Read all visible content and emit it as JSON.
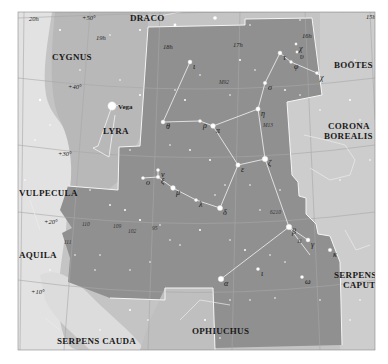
{
  "map": {
    "title": "Hercules star chart",
    "colors": {
      "page_bg": "#ffffff",
      "sky_outer": "#d3d3d3",
      "sky_mid": "#bdbdbd",
      "milky_way": "#e4e4e4",
      "hercules": "#8f8f8f",
      "boundary": "#ffffff",
      "gridline": "#9a9a9a",
      "figure_line": "#f2f2f2",
      "star": "#ffffff"
    },
    "constellations": [
      {
        "name": "DRACO",
        "x": 130,
        "y": 21
      },
      {
        "name": "CYGNUS",
        "x": 52,
        "y": 60
      },
      {
        "name": "BOÖTES",
        "x": 334,
        "y": 68
      },
      {
        "name": "LYRA",
        "x": 103,
        "y": 134
      },
      {
        "name": "CORONA",
        "x": 328,
        "y": 129
      },
      {
        "name": "BOREALIS",
        "x": 324,
        "y": 139
      },
      {
        "name": "VULPECULA",
        "x": 19,
        "y": 196
      },
      {
        "name": "AQUILA",
        "x": 19,
        "y": 258
      },
      {
        "name": "SERPENS",
        "x": 334,
        "y": 278
      },
      {
        "name": "CAPUT",
        "x": 343,
        "y": 288
      },
      {
        "name": "OPHIUCHUS",
        "x": 192,
        "y": 334
      },
      {
        "name": "SERPENS CAUDA",
        "x": 57,
        "y": 344
      }
    ],
    "grid_labels": [
      {
        "text": "20h",
        "x": 29,
        "y": 21
      },
      {
        "text": "+50°",
        "x": 82,
        "y": 20
      },
      {
        "text": "19h",
        "x": 96,
        "y": 40
      },
      {
        "text": "18h",
        "x": 163,
        "y": 49
      },
      {
        "text": "17h",
        "x": 233,
        "y": 47
      },
      {
        "text": "16h",
        "x": 302,
        "y": 38
      },
      {
        "text": "15h",
        "x": 366,
        "y": 19
      },
      {
        "text": "+40°",
        "x": 68,
        "y": 89
      },
      {
        "text": "+30°",
        "x": 58,
        "y": 156
      },
      {
        "text": "+20°",
        "x": 44,
        "y": 224
      },
      {
        "text": "+10°",
        "x": 31,
        "y": 294
      }
    ],
    "stars_labeled": [
      {
        "label": "Vega",
        "x": 112,
        "y": 106,
        "r": 4.2,
        "cls": "vega"
      },
      {
        "label": "τ",
        "x": 280,
        "y": 53,
        "r": 2,
        "cls": "star"
      },
      {
        "label": "χ",
        "x": 296,
        "y": 44,
        "r": 1.2,
        "cls": "star"
      },
      {
        "label": "υ",
        "x": 297,
        "y": 52,
        "r": 1.2,
        "cls": "star"
      },
      {
        "label": "φ",
        "x": 291,
        "y": 62,
        "r": 1.4,
        "cls": "star"
      },
      {
        "label": "χ",
        "x": 317,
        "y": 73,
        "r": 1.6,
        "cls": "star"
      },
      {
        "label": "ι",
        "x": 190,
        "y": 62,
        "r": 2,
        "cls": "star"
      },
      {
        "label": "σ",
        "x": 265,
        "y": 83,
        "r": 1.8,
        "cls": "star"
      },
      {
        "label": "η",
        "x": 258,
        "y": 109,
        "r": 2.2,
        "cls": "star"
      },
      {
        "label": "θ",
        "x": 163,
        "y": 122,
        "r": 2,
        "cls": "star"
      },
      {
        "label": "ρ",
        "x": 200,
        "y": 121,
        "r": 1.6,
        "cls": "star"
      },
      {
        "label": "π",
        "x": 213,
        "y": 126,
        "r": 2.4,
        "cls": "star"
      },
      {
        "label": "ζ",
        "x": 265,
        "y": 159,
        "r": 2.8,
        "cls": "star"
      },
      {
        "label": "ε",
        "x": 238,
        "y": 165,
        "r": 2.2,
        "cls": "star"
      },
      {
        "label": "ν",
        "x": 158,
        "y": 170,
        "r": 1.6,
        "cls": "star"
      },
      {
        "label": "ο",
        "x": 143,
        "y": 178,
        "r": 1.6,
        "cls": "star"
      },
      {
        "label": "ξ",
        "x": 158,
        "y": 177,
        "r": 1.8,
        "cls": "star"
      },
      {
        "label": "μ",
        "x": 173,
        "y": 188,
        "r": 2.4,
        "cls": "star"
      },
      {
        "label": "λ",
        "x": 196,
        "y": 200,
        "r": 1.6,
        "cls": "star"
      },
      {
        "label": "δ",
        "x": 220,
        "y": 208,
        "r": 2.6,
        "cls": "star"
      },
      {
        "label": "β",
        "x": 289,
        "y": 227,
        "r": 2.8,
        "cls": "star"
      },
      {
        "label": "γ",
        "x": 308,
        "y": 240,
        "r": 2,
        "cls": "star"
      },
      {
        "label": "ω",
        "x": 302,
        "y": 277,
        "r": 1.6,
        "cls": "star"
      },
      {
        "label": "κ",
        "x": 330,
        "y": 250,
        "r": 1.8,
        "cls": "star"
      },
      {
        "label": "α",
        "x": 221,
        "y": 279,
        "r": 2.8,
        "cls": "star"
      },
      {
        "label": "ι",
        "x": 258,
        "y": 269,
        "r": 1.6,
        "cls": "star"
      }
    ],
    "star_number_labels": [
      {
        "text": "M92",
        "x": 219,
        "y": 84
      },
      {
        "text": "M13",
        "x": 263,
        "y": 127
      },
      {
        "text": "6210",
        "x": 270,
        "y": 214
      },
      {
        "text": "110",
        "x": 82,
        "y": 226
      },
      {
        "text": "109",
        "x": 113,
        "y": 228
      },
      {
        "text": "102",
        "x": 128,
        "y": 233
      },
      {
        "text": "95",
        "x": 152,
        "y": 230
      },
      {
        "text": "111",
        "x": 64,
        "y": 244
      },
      {
        "text": "11",
        "x": 297,
        "y": 243
      }
    ],
    "figure_lines": [
      [
        [
          280,
          53
        ],
        [
          265,
          83
        ],
        [
          258,
          109
        ],
        [
          213,
          126
        ],
        [
          200,
          121
        ],
        [
          163,
          122
        ],
        [
          190,
          62
        ]
      ],
      [
        [
          280,
          53
        ],
        [
          291,
          62
        ],
        [
          317,
          73
        ],
        [
          320,
          76
        ]
      ],
      [
        [
          258,
          109
        ],
        [
          265,
          159
        ],
        [
          238,
          165
        ],
        [
          213,
          126
        ]
      ],
      [
        [
          238,
          165
        ],
        [
          220,
          208
        ],
        [
          196,
          200
        ],
        [
          173,
          188
        ],
        [
          158,
          177
        ],
        [
          143,
          178
        ]
      ],
      [
        [
          158,
          177
        ],
        [
          158,
          170
        ]
      ],
      [
        [
          265,
          159
        ],
        [
          289,
          227
        ],
        [
          308,
          240
        ]
      ],
      [
        [
          289,
          227
        ],
        [
          221,
          279
        ]
      ],
      [
        [
          289,
          227
        ],
        [
          310,
          255
        ]
      ],
      [
        [
          112,
          106
        ],
        [
          98,
          146
        ],
        [
          93,
          148
        ],
        [
          109,
          157
        ],
        [
          115,
          115
        ]
      ],
      [
        [
          112,
          106
        ],
        [
          120,
          105
        ]
      ]
    ],
    "neighbor_lines": [
      [
        [
          133,
          14
        ],
        [
          150,
          18
        ],
        [
          190,
          10
        ]
      ],
      [
        [
          304,
          135
        ],
        [
          326,
          140
        ],
        [
          345,
          145
        ],
        [
          355,
          160
        ],
        [
          350,
          175
        ],
        [
          330,
          180
        ],
        [
          310,
          168
        ]
      ],
      [
        [
          345,
          230
        ],
        [
          356,
          250
        ],
        [
          370,
          245
        ]
      ],
      [
        [
          180,
          320
        ],
        [
          200,
          300
        ],
        [
          230,
          305
        ]
      ],
      [
        [
          30,
          200
        ],
        [
          40,
          230
        ]
      ],
      [
        [
          45,
          318
        ],
        [
          60,
          330
        ]
      ]
    ],
    "background_stars": [
      [
        60,
        30,
        1
      ],
      [
        110,
        35,
        0.8
      ],
      [
        140,
        30,
        1
      ],
      [
        175,
        25,
        1.4
      ],
      [
        215,
        18,
        1.8
      ],
      [
        250,
        25,
        0.8
      ],
      [
        300,
        20,
        0.8
      ],
      [
        40,
        100,
        1.2
      ],
      [
        50,
        125,
        0.8
      ],
      [
        80,
        70,
        0.8
      ],
      [
        120,
        80,
        0.8
      ],
      [
        140,
        95,
        1
      ],
      [
        130,
        150,
        0.8
      ],
      [
        175,
        90,
        0.8
      ],
      [
        185,
        100,
        1
      ],
      [
        200,
        75,
        0.8
      ],
      [
        240,
        60,
        1
      ],
      [
        255,
        70,
        0.8
      ],
      [
        230,
        95,
        0.8
      ],
      [
        285,
        90,
        0.9
      ],
      [
        300,
        95,
        0.8
      ],
      [
        320,
        110,
        0.8
      ],
      [
        350,
        100,
        1
      ],
      [
        360,
        120,
        0.8
      ],
      [
        370,
        160,
        0.8
      ],
      [
        170,
        145,
        0.8
      ],
      [
        190,
        150,
        0.9
      ],
      [
        210,
        160,
        1
      ],
      [
        225,
        185,
        0.8
      ],
      [
        250,
        185,
        0.8
      ],
      [
        280,
        190,
        0.8
      ],
      [
        200,
        230,
        1
      ],
      [
        180,
        245,
        0.8
      ],
      [
        230,
        240,
        0.8
      ],
      [
        245,
        250,
        1
      ],
      [
        270,
        255,
        0.8
      ],
      [
        285,
        262,
        0.8
      ],
      [
        90,
        190,
        0.8
      ],
      [
        110,
        205,
        0.9
      ],
      [
        125,
        210,
        1
      ],
      [
        140,
        220,
        1.1
      ],
      [
        160,
        225,
        0.8
      ],
      [
        170,
        240,
        0.8
      ],
      [
        150,
        262,
        0.8
      ],
      [
        130,
        270,
        0.8
      ],
      [
        100,
        255,
        0.8
      ],
      [
        95,
        270,
        0.8
      ],
      [
        75,
        255,
        0.8
      ],
      [
        230,
        300,
        0.8
      ],
      [
        250,
        300,
        0.8
      ],
      [
        275,
        298,
        0.8
      ],
      [
        320,
        300,
        0.8
      ],
      [
        350,
        320,
        0.8
      ],
      [
        360,
        300,
        0.8
      ],
      [
        130,
        310,
        1
      ],
      [
        148,
        320,
        0.8
      ],
      [
        205,
        320,
        1
      ],
      [
        220,
        338,
        0.8
      ],
      [
        100,
        330,
        0.8
      ],
      [
        50,
        270,
        0.8
      ],
      [
        35,
        140,
        0.8
      ],
      [
        25,
        180,
        0.8
      ],
      [
        260,
        210,
        0.8
      ],
      [
        215,
        195,
        0.8
      ],
      [
        355,
        60,
        0.8
      ],
      [
        340,
        180,
        0.8
      ]
    ]
  }
}
